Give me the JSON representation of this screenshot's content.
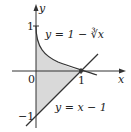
{
  "diagram": {
    "type": "region-between-curves",
    "axes": {
      "x_label": "x",
      "y_label": "y",
      "origin_label": "0"
    },
    "ticks": {
      "x_one": "1",
      "y_one": "1",
      "y_neg_one": "−1"
    },
    "curves": [
      {
        "name": "cube-root-curve",
        "label": "y = 1 − ∛x"
      },
      {
        "name": "line",
        "label": "y = x − 1"
      }
    ],
    "shaded_region": {
      "from_x": 0,
      "to_x": 1,
      "fill": "#d9d9d9"
    },
    "colors": {
      "curve": "#333333",
      "axis": "#333333",
      "shade": "#d9d9d9"
    }
  }
}
